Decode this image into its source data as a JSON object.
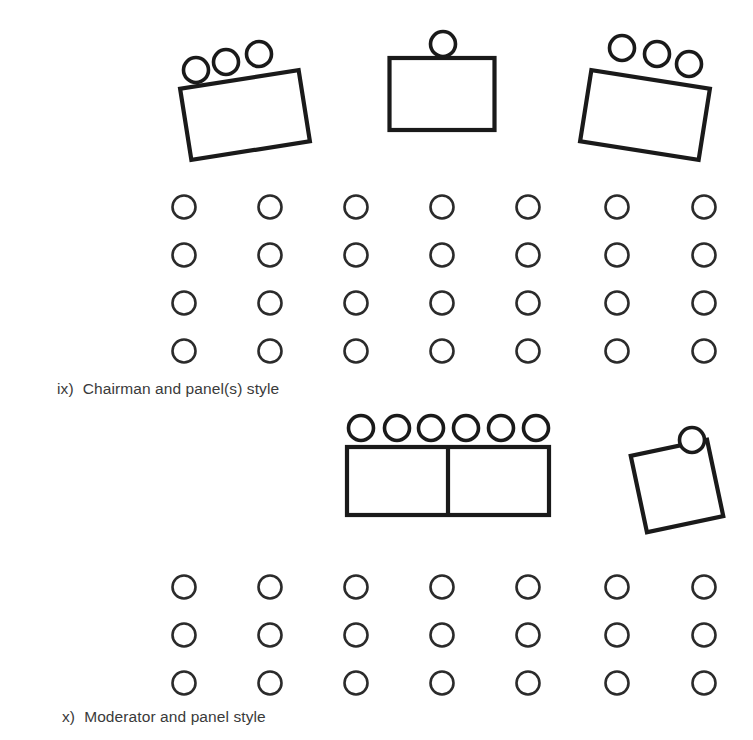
{
  "figure": {
    "title_visible": false,
    "background_color": "#ffffff",
    "ink_color": "#1a1a1a",
    "text_color": "#3a3a3a",
    "width": 753,
    "height": 740
  },
  "sections": [
    {
      "id": "chairman-and-panels",
      "numeral": "ix)",
      "label": "Chairman and panel(s) style",
      "caption_full": "ix)  Chairman and panel(s) style",
      "front_tables": [
        {
          "name": "left-panel-table",
          "shape": "rectangle",
          "rotation_deg": -9,
          "chair_count": 3,
          "chair_side": "top"
        },
        {
          "name": "center-chairman-table",
          "shape": "rectangle",
          "rotation_deg": 0,
          "chair_count": 1,
          "chair_side": "top"
        },
        {
          "name": "right-panel-table",
          "shape": "rectangle",
          "rotation_deg": 9,
          "chair_count": 3,
          "chair_side": "top"
        }
      ],
      "audience": {
        "rows": 4,
        "columns": 7,
        "total_seats": 28
      }
    },
    {
      "id": "moderator-and-panel",
      "numeral": "x)",
      "label": "Moderator and panel style",
      "caption_full": "x)  Moderator and panel style",
      "front_tables": [
        {
          "name": "panel-double-table",
          "shape": "two-joined-rectangles",
          "rotation_deg": 0,
          "chair_count": 6,
          "chair_side": "top"
        },
        {
          "name": "moderator-table",
          "shape": "square",
          "rotation_deg": -12,
          "chair_count": 1,
          "chair_side": "top"
        }
      ],
      "audience": {
        "rows": 3,
        "columns": 7,
        "total_seats": 21
      }
    }
  ],
  "geometry": {
    "audience_seat_radius": 11.5,
    "panel_chair_radius": 12.5,
    "audience_column_x": [
      184,
      270,
      356,
      442,
      528,
      617,
      704
    ],
    "audience_rows_top_y": [
      207,
      255,
      303,
      351
    ],
    "audience_rows_bottom_y": [
      587,
      635,
      683
    ],
    "left_table": {
      "cx": 245,
      "cy": 115,
      "w": 120,
      "h": 72,
      "rotate": -9
    },
    "center_table": {
      "cx": 442,
      "cy": 94,
      "w": 105,
      "h": 72,
      "rotate": 0
    },
    "right_table": {
      "cx": 645,
      "cy": 115,
      "w": 120,
      "h": 72,
      "rotate": 9
    },
    "panel_double_table": {
      "x": 347,
      "y": 447,
      "w": 202,
      "h": 68,
      "split_x": 448
    },
    "moderator_table": {
      "cx": 677,
      "cy": 486,
      "w": 78,
      "h": 78,
      "rotate": -12
    },
    "left_table_chairs": [
      {
        "cx": 196,
        "cy": 70
      },
      {
        "cx": 226,
        "cy": 62
      },
      {
        "cx": 259,
        "cy": 54
      }
    ],
    "center_table_chairs": [
      {
        "cx": 443,
        "cy": 44
      }
    ],
    "right_table_chairs": [
      {
        "cx": 622,
        "cy": 48
      },
      {
        "cx": 657,
        "cy": 54
      },
      {
        "cx": 689,
        "cy": 64
      }
    ],
    "panel_table_chairs": [
      {
        "cx": 361,
        "cy": 428
      },
      {
        "cx": 397,
        "cy": 428
      },
      {
        "cx": 431,
        "cy": 428
      },
      {
        "cx": 466,
        "cy": 428
      },
      {
        "cx": 501,
        "cy": 428
      },
      {
        "cx": 536,
        "cy": 428
      }
    ],
    "moderator_table_chairs": [
      {
        "cx": 692,
        "cy": 440
      }
    ]
  }
}
